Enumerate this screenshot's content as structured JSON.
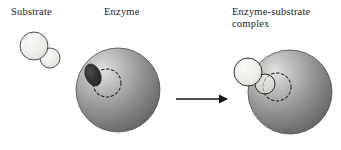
{
  "figure": {
    "width": 341,
    "height": 150,
    "background": "#ffffff"
  },
  "labels": {
    "substrate": "Substrate",
    "enzyme": "Enzyme",
    "complex_line1": "Enzyme-substrate",
    "complex_line2": "complex"
  },
  "colors": {
    "text": "#1a1a1a",
    "outline": "#3a3a3a",
    "substrate_fill_light": "#f2f2f0",
    "substrate_fill_mid": "#dcdcd8",
    "enzyme_highlight": "#d8d8d6",
    "enzyme_mid": "#9a9a99",
    "enzyme_dark": "#6a6a6a",
    "active_site_dark": "#2b2b2b",
    "arrow": "#141414",
    "dashed_outline": "#2b2b2b"
  },
  "panels": {
    "substrate_free": {
      "name": "free substrate",
      "big_circle": {
        "cx": 34,
        "cy": 46,
        "r": 14
      },
      "small_circle": {
        "cx": 50,
        "cy": 58,
        "r": 10
      }
    },
    "enzyme_free": {
      "name": "free enzyme",
      "sphere": {
        "cx": 118,
        "cy": 90,
        "r": 42
      },
      "active_site_notch": {
        "cx": 94,
        "cy": 75,
        "rx": 7,
        "ry": 11,
        "rotation": -25
      },
      "active_site_outline": {
        "cx": 107,
        "cy": 83,
        "r": 14
      }
    },
    "arrow": {
      "name": "reaction arrow",
      "x1": 176,
      "y1": 99,
      "x2": 230,
      "y2": 99
    },
    "complex": {
      "name": "enzyme-substrate complex",
      "sphere": {
        "cx": 290,
        "cy": 92,
        "r": 42
      },
      "big_circle": {
        "cx": 248,
        "cy": 72,
        "r": 14
      },
      "small_circle": {
        "cx": 265,
        "cy": 84,
        "r": 10
      },
      "active_site_outline": {
        "cx": 277,
        "cy": 87,
        "r": 14
      }
    }
  }
}
